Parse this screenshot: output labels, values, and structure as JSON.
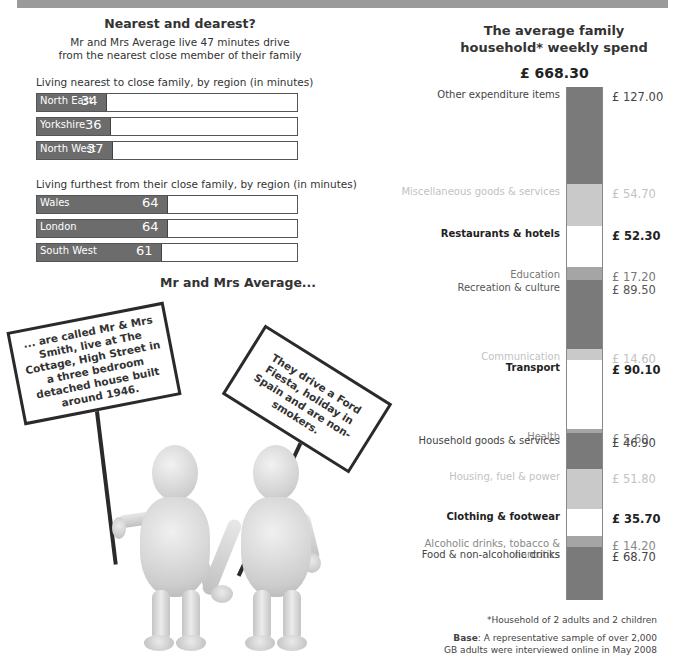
{
  "banner": {
    "color": "#9a9a9a"
  },
  "nearest": {
    "title": "Nearest and dearest?",
    "subtitle_line1": "Mr and Mrs Average live 47 minutes drive",
    "subtitle_line2": "from the nearest close member of their family",
    "nearest_label": "Living nearest to close family, by region (in minutes)",
    "furthest_label": "Living furthest from their close family, by region (in minutes)"
  },
  "mr_mrs": {
    "title": "Mr and Mrs Average...",
    "sign1": "... are called Mr & Mrs Smith, live at The Cottage, High Street in a three bedroom detached house built around 1946.",
    "sign2": "They drive a Ford Fiesta, holiday in Spain and are non-smokers."
  },
  "spend": {
    "title_line1": "The average family",
    "title_line2": "household* weekly spend",
    "total": "£ 668.30"
  },
  "footnote": {
    "household": "*Household of 2 adults and 2 children",
    "base_bold": "Base",
    "base_text": ": A representative sample of over 2,000",
    "base_line2": "GB adults were interviewed online in May 2008"
  },
  "chart_data": [
    {
      "type": "bar",
      "orientation": "horizontal",
      "title": "Living nearest to close family, by region (in minutes)",
      "categories": [
        "North East",
        "Yorkshire",
        "North West"
      ],
      "values": [
        34,
        36,
        37
      ],
      "xlabel": "minutes",
      "ylabel": "",
      "xlim": [
        0,
        128
      ],
      "grid": false,
      "colors": {
        "fill": "#6c6c6c",
        "track": "#ffffff"
      }
    },
    {
      "type": "bar",
      "orientation": "horizontal",
      "title": "Living furthest from their close family, by region (in minutes)",
      "categories": [
        "Wales",
        "London",
        "South West"
      ],
      "values": [
        64,
        64,
        61
      ],
      "xlabel": "minutes",
      "ylabel": "",
      "xlim": [
        0,
        128
      ],
      "grid": false,
      "colors": {
        "fill": "#6c6c6c",
        "track": "#ffffff"
      }
    },
    {
      "type": "bar",
      "stacked": true,
      "title": "The average family household* weekly spend",
      "total": 668.3,
      "currency": "£",
      "categories": [
        "Other expenditure items",
        "Miscellaneous goods & services",
        "Restaurants & hotels",
        "Education",
        "Recreation & culture",
        "Communication",
        "Transport",
        "Health",
        "Household goods & services",
        "Housing, fuel & power",
        "Clothing & footwear",
        "Alcoholic drinks, tobacco & narcotics",
        "Food & non-alcoholic drinks"
      ],
      "values": [
        127.0,
        54.7,
        52.3,
        17.2,
        89.5,
        14.6,
        90.1,
        5.6,
        46.9,
        51.8,
        35.7,
        14.2,
        68.7
      ],
      "labels": [
        "£ 127.00",
        "£ 54.70",
        "£ 52.30",
        "£ 17.20",
        "£ 89.50",
        "£ 14.60",
        "£ 90.10",
        "£ 5.60",
        "£ 46.90",
        "£ 51.80",
        "£ 35.70",
        "£ 14.20",
        "£ 68.70"
      ],
      "segment_colors": [
        "#7a7a7a",
        "#c9c9c9",
        "#ffffff",
        "#a5a5a5",
        "#7a7a7a",
        "#c9c9c9",
        "#ffffff",
        "#a5a5a5",
        "#7a7a7a",
        "#c9c9c9",
        "#ffffff",
        "#a5a5a5",
        "#7a7a7a"
      ],
      "legend": "none",
      "grid": false
    }
  ]
}
